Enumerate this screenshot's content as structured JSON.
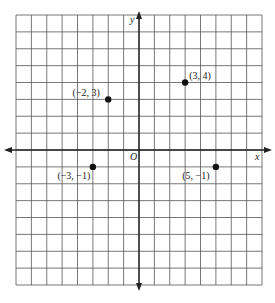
{
  "chart_data": {
    "type": "scatter",
    "title": "",
    "xlabel": "x",
    "ylabel": "y",
    "origin_label": "O",
    "xlim": [
      -8,
      8
    ],
    "ylim": [
      -8,
      8
    ],
    "grid": true,
    "legend": null,
    "points": [
      {
        "x": -2,
        "y": 3,
        "label": "(−2, 3)"
      },
      {
        "x": 3,
        "y": 4,
        "label": "(3, 4)"
      },
      {
        "x": -3,
        "y": -1,
        "label": "(−3, −1)"
      },
      {
        "x": 5,
        "y": -1,
        "label": "(5, −1)"
      }
    ]
  },
  "colors": {
    "grid": "#555555",
    "axis": "#222222",
    "point": "#111111",
    "background": "#ffffff"
  }
}
